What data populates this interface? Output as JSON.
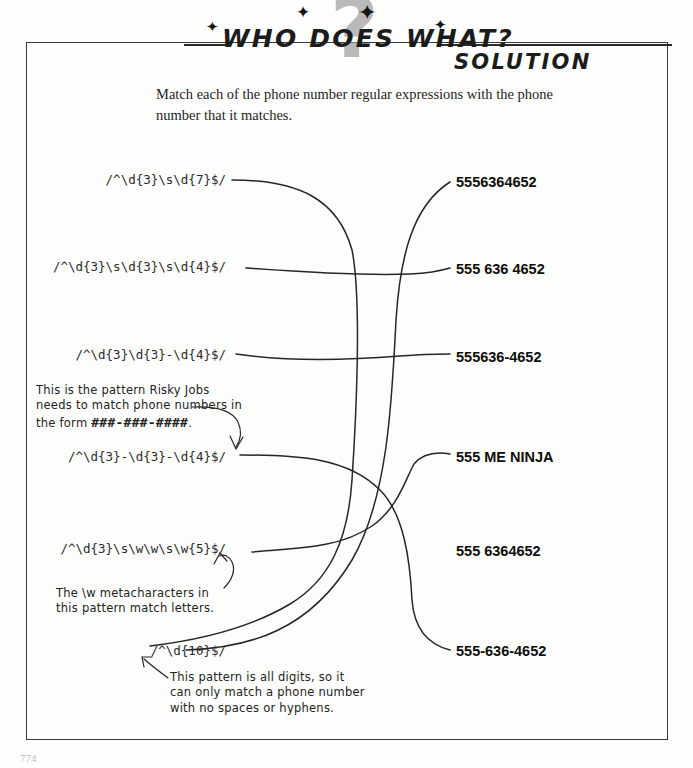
{
  "header": {
    "title": "WHO DOES WHAT?",
    "subtitle": "SOLUTION",
    "watermark_glyph": "?",
    "sparkle_glyph": "✦"
  },
  "instructions": "Match each of the phone number regular expressions with the phone number that it matches.",
  "left_column": {
    "label": "regular-expressions",
    "items": [
      {
        "id": "re1",
        "text": "/^\\d{3}\\s\\d{7}$/"
      },
      {
        "id": "re2",
        "text": "/^\\d{3}\\s\\d{3}\\s\\d{4}$/"
      },
      {
        "id": "re3",
        "text": "/^\\d{3}\\d{3}-\\d{4}$/"
      },
      {
        "id": "re4",
        "text": "/^\\d{3}-\\d{3}-\\d{4}$/"
      },
      {
        "id": "re5",
        "text": "/^\\d{3}\\s\\w\\w\\s\\w{5}$/"
      },
      {
        "id": "re6",
        "text": "/^\\d{10}$/"
      }
    ]
  },
  "right_column": {
    "label": "phone-numbers",
    "items": [
      {
        "id": "ph1",
        "text": "5556364652"
      },
      {
        "id": "ph2",
        "text": "555 636 4652"
      },
      {
        "id": "ph3",
        "text": "555636-4652"
      },
      {
        "id": "ph4",
        "text": "555 ME NINJA"
      },
      {
        "id": "ph5",
        "text": "555 6364652"
      },
      {
        "id": "ph6",
        "text": "555-636-4652"
      }
    ]
  },
  "matches": [
    {
      "from": "re1",
      "to": "ph5"
    },
    {
      "from": "re2",
      "to": "ph2"
    },
    {
      "from": "re3",
      "to": "ph3"
    },
    {
      "from": "re4",
      "to": "ph6"
    },
    {
      "from": "re5",
      "to": "ph4"
    },
    {
      "from": "re6",
      "to": "ph1"
    }
  ],
  "annotations": [
    {
      "id": "annot-risky-jobs",
      "line1": "This is the pattern Risky Jobs",
      "line2": "needs to match phone numbers in",
      "line3_prefix": "the form ",
      "line3_mono": "###-###-####",
      "line3_suffix": "."
    },
    {
      "id": "annot-metacharacters",
      "line1": "The \\w metacharacters in",
      "line2": "this pattern match letters."
    },
    {
      "id": "annot-all-digits",
      "line1": "This pattern is all digits, so it",
      "line2": "can only match a phone number",
      "line3": "with no spaces or hyphens."
    }
  ],
  "folio": "774"
}
